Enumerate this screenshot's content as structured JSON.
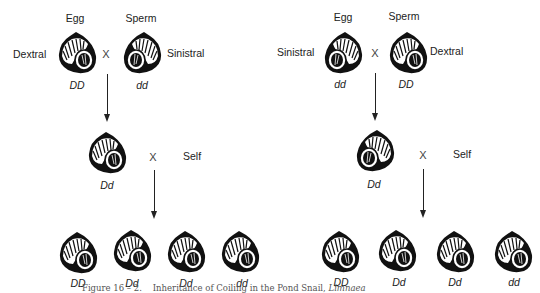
{
  "figure": {
    "caption_prefix": "Figure 16 – 2.",
    "caption_text": "Inheritance of Coiling in the Pond Snail,",
    "caption_genus": "Limnaea"
  },
  "left_cross": {
    "egg_label": "Egg",
    "sperm_label": "Sperm",
    "egg_coil": "Dextral",
    "sperm_coil": "Sinistral",
    "egg_genotype": "DD",
    "sperm_genotype": "dd",
    "cross_symbol": "X",
    "f1_genotype": "Dd",
    "self_symbol": "X",
    "self_label": "Self",
    "f2_genotypes": [
      "DD",
      "Dd",
      "Dd",
      "dd"
    ]
  },
  "right_cross": {
    "egg_label": "Egg",
    "sperm_label": "Sperm",
    "egg_coil": "Sinistral",
    "sperm_coil": "Dextral",
    "egg_genotype": "dd",
    "sperm_genotype": "DD",
    "cross_symbol": "X",
    "f1_genotype": "Dd",
    "self_symbol": "X",
    "self_label": "Self",
    "f2_genotypes": [
      "DD",
      "Dd",
      "Dd",
      "dd"
    ]
  },
  "icons": {
    "dextral_snail": "dextral-snail-shell-icon",
    "sinistral_snail": "sinistral-snail-shell-icon",
    "arrow": "down-arrow"
  }
}
